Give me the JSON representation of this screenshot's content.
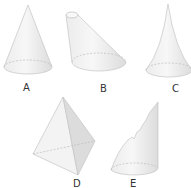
{
  "figure": {
    "shapes": [
      {
        "label": "A",
        "type": "right cone"
      },
      {
        "label": "B",
        "type": "oblique truncated cone (frustum)"
      },
      {
        "label": "C",
        "type": "cone with concave sides"
      },
      {
        "label": "D",
        "type": "tetrahedron (triangular pyramid)"
      },
      {
        "label": "E",
        "type": "cone with cut/broken side"
      }
    ]
  },
  "colors": {
    "fill": "#f1f1f1",
    "fill_dark": "#dedede",
    "edge": "#bdbdbd",
    "label": "#333333"
  }
}
